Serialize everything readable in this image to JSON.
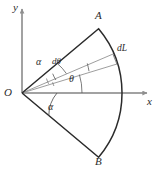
{
  "figure": {
    "type": "geometry-diagram",
    "colors": {
      "outline": "#2b2b2b",
      "axis": "#9b9b9b",
      "thin_ray": "#8a8a8a",
      "background": "#ffffff",
      "text": "#2b2b2b"
    },
    "geometry": {
      "origin": {
        "x": 22,
        "y": 93
      },
      "radius": 100,
      "half_angle_deg": 40,
      "theta_deg": 17,
      "dtheta_deg": 6,
      "point_a": {
        "x": 98.6,
        "y": 28.7
      },
      "point_b": {
        "x": 98.6,
        "y": 157.3
      },
      "arc_apex": {
        "x": 122,
        "y": 93
      }
    },
    "axes": {
      "x_label": "x",
      "y_label": "y",
      "x_start": {
        "x": 22,
        "y": 93
      },
      "x_end": {
        "x": 150,
        "y": 93
      },
      "y_start": {
        "x": 22,
        "y": 93
      },
      "y_end": {
        "x": 22,
        "y": 6
      }
    },
    "labels": {
      "origin": "O",
      "point_a": "A",
      "point_b": "B",
      "x_axis": "x",
      "y_axis": "y",
      "alpha_upper": "α",
      "alpha_lower": "α",
      "theta": "θ",
      "dtheta": "dθ",
      "dl": "dL"
    }
  }
}
